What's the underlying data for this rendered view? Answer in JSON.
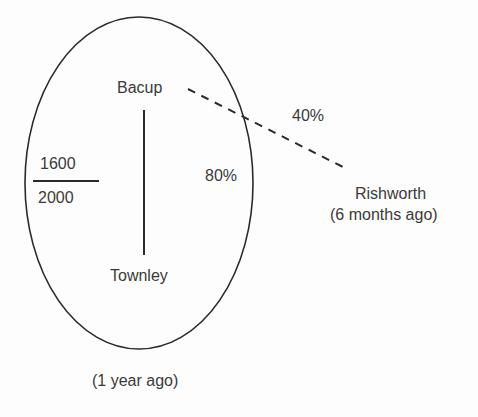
{
  "diagram": {
    "nodes": {
      "bacup": "Bacup",
      "townley": "Townley",
      "rishworth": "Rishworth",
      "rishworth_time": "(6 months ago)"
    },
    "ellipse_caption": "(1 year ago)",
    "fraction": {
      "numerator": "1600",
      "denominator": "2000"
    },
    "edges": [
      {
        "from": "Bacup",
        "to": "Townley",
        "style": "solid",
        "label": "80%"
      },
      {
        "from": "Bacup",
        "to": "Rishworth",
        "style": "dashed",
        "label": "40%"
      }
    ],
    "colors": {
      "stroke": "#2a2a2a",
      "text": "#3a3a3a",
      "background": "#fdfdfd"
    }
  }
}
